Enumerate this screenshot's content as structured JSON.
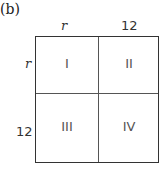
{
  "panel": {
    "label": "(b)"
  },
  "axes": {
    "top": [
      "r",
      "12"
    ],
    "left": [
      "r",
      "12"
    ]
  },
  "cells": [
    {
      "id": "I",
      "row": "r",
      "col": "r"
    },
    {
      "id": "II",
      "row": "r",
      "col": "12"
    },
    {
      "id": "III",
      "row": "12",
      "col": "r"
    },
    {
      "id": "IV",
      "row": "12",
      "col": "12"
    }
  ]
}
